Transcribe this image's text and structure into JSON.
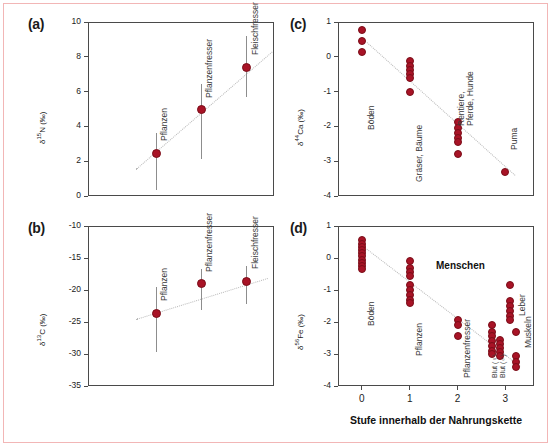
{
  "figure": {
    "marker_color": "#a81326",
    "axis_color": "#4a4a4a",
    "trend_color": "#b9b9b9",
    "xaxis_title": "Stufe innerhalb der Nahrungskette"
  },
  "chart_data": [
    {
      "type": "scatter",
      "panel": "(a)",
      "title": "",
      "ylabel": "δ¹⁵N (‰)",
      "ylabel_delta": "δ",
      "ylabel_sup": "15",
      "ylabel_rest": "N (‰)",
      "xlabel": "",
      "ylim": [
        0,
        10
      ],
      "xlim": [
        -0.5,
        3.6
      ],
      "yticks": [
        10,
        8,
        6,
        4,
        2,
        0
      ],
      "xticks": [],
      "grid": false,
      "legend": "none",
      "categories": [
        "Pflanzen",
        "Pflanzenfresser",
        "Fleischfresser"
      ],
      "x": [
        1.0,
        2.0,
        3.0
      ],
      "values": [
        2.45,
        4.95,
        7.4
      ],
      "err_low": [
        0.35,
        2.1,
        5.7
      ],
      "err_high": [
        3.6,
        6.45,
        9.2
      ],
      "trendline": {
        "x0": 0.55,
        "y0": 1.55,
        "x1": 3.55,
        "y1": 8.3
      }
    },
    {
      "type": "scatter",
      "panel": "(b)",
      "title": "",
      "ylabel": "δ¹³C (‰)",
      "ylabel_delta": "δ",
      "ylabel_sup": "13",
      "ylabel_rest": "C (‰)",
      "xlabel": "",
      "ylim": [
        -35,
        -10
      ],
      "xlim": [
        -0.5,
        3.6
      ],
      "yticks": [
        -10,
        -15,
        -20,
        -25,
        -30,
        -35
      ],
      "xticks": [],
      "grid": false,
      "legend": "none",
      "categories": [
        "Pflanzen",
        "Pflanzenfresser",
        "Fleischfresser"
      ],
      "x": [
        1.0,
        2.0,
        3.0
      ],
      "values": [
        -23.6,
        -19.0,
        -18.6
      ],
      "err_low": [
        -29.7,
        -23.1,
        -22.2
      ],
      "err_high": [
        -19.6,
        -16.7,
        -16.2
      ],
      "trendline": {
        "x0": 0.55,
        "y0": -24.6,
        "x1": 3.45,
        "y1": -18.2
      }
    },
    {
      "type": "scatter",
      "panel": "(c)",
      "title": "",
      "ylabel": "δ⁴⁴Ca (‰)",
      "ylabel_delta": "δ",
      "ylabel_sup": "44",
      "ylabel_rest": "Ca (‰)",
      "xlabel": "",
      "ylim": [
        -4,
        1
      ],
      "xlim": [
        -0.5,
        3.6
      ],
      "yticks": [
        1,
        0,
        -1,
        -2,
        -3,
        -4
      ],
      "xticks": [],
      "grid": false,
      "legend": "none",
      "groups": [
        {
          "label": "Böden",
          "x": 0.0,
          "values": [
            0.78,
            0.45,
            0.15
          ]
        },
        {
          "label": "Gräser, Bäume",
          "x": 1.0,
          "values": [
            -0.12,
            -0.26,
            -0.38,
            -0.5,
            -0.62,
            -1.0
          ]
        },
        {
          "label": "Rentiere,\nPferde, Hunde",
          "x": 2.0,
          "values": [
            -1.88,
            -2.05,
            -2.2,
            -2.33,
            -2.45,
            -2.78
          ]
        },
        {
          "label": "Puma",
          "x": 3.0,
          "values": [
            -3.3
          ]
        }
      ],
      "trendline": {
        "x0": 0.1,
        "y0": 0.42,
        "x1": 3.2,
        "y1": -3.4
      }
    },
    {
      "type": "scatter",
      "panel": "(d)",
      "title": "",
      "ylabel": "δ⁵⁶Fe (‰)",
      "ylabel_delta": "δ",
      "ylabel_sup": "56",
      "ylabel_rest": "Fe (‰)",
      "xlabel": "Stufe innerhalb der Nahrungskette",
      "ylim": [
        -4,
        1
      ],
      "xlim": [
        -0.5,
        3.6
      ],
      "yticks": [
        1,
        0,
        -1,
        -2,
        -3,
        -4
      ],
      "xticks": [
        0,
        1,
        2,
        3
      ],
      "grid": false,
      "legend": "none",
      "annotation": "Menschen",
      "groups": [
        {
          "label": "Böden",
          "x": 0.0,
          "values": [
            0.55,
            0.45,
            0.35,
            0.25,
            0.15,
            0.05,
            -0.05,
            -0.15,
            -0.25,
            -0.35
          ]
        },
        {
          "label": "Pflanzen",
          "x": 1.0,
          "values": [
            -0.1,
            -0.3,
            -0.45,
            -0.55,
            -0.85,
            -1.0,
            -1.15,
            -1.3,
            -1.42
          ]
        },
        {
          "label": "Pflanzenfresser",
          "x": 2.0,
          "values": [
            -1.95,
            -2.1,
            -2.45
          ]
        },
        {
          "label": "Blut (♀)",
          "x": 2.72,
          "values": [
            -2.1,
            -2.3,
            -2.45,
            -2.6,
            -2.75,
            -2.9,
            -3.0
          ]
        },
        {
          "label": "Blut (♂)",
          "x": 2.88,
          "values": [
            -2.55,
            -2.7,
            -2.82,
            -2.95,
            -3.05
          ]
        },
        {
          "label": "Leber",
          "x": 3.1,
          "values": [
            -0.85,
            -1.35,
            -1.5,
            -1.65,
            -1.8,
            -1.95
          ]
        },
        {
          "label": "Muskeln",
          "x": 3.22,
          "values": [
            -2.3,
            -3.05,
            -3.25,
            -3.4
          ]
        }
      ],
      "trendline": {
        "x0": 0.0,
        "y0": 0.42,
        "x1": 3.3,
        "y1": -3.35
      }
    }
  ]
}
